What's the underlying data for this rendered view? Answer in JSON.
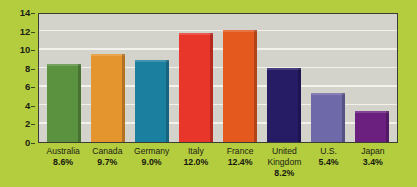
{
  "chart_data": {
    "type": "bar",
    "title": "",
    "xlabel": "",
    "ylabel": "",
    "categories": [
      "Australia",
      "Canada",
      "Germany",
      "Italy",
      "France",
      "United\nKingdom",
      "U.S.",
      "Japan"
    ],
    "values": [
      8.6,
      9.7,
      9.0,
      12.0,
      12.4,
      8.2,
      5.4,
      3.4
    ],
    "data_labels": [
      "8.6%",
      "9.7%",
      "9.0%",
      "12.0%",
      "12.4%",
      "8.2%",
      "5.4%",
      "3.4%"
    ],
    "ylim": [
      0,
      14
    ],
    "yticks": [
      0,
      2,
      4,
      6,
      8,
      10,
      12,
      14
    ],
    "ytick_labels": [
      "0",
      "2",
      "4",
      "6",
      "8",
      "10",
      "12",
      "14"
    ],
    "grid": true,
    "legend": "none",
    "bar_colors": [
      "#5b9240",
      "#e5952d",
      "#1b7f9f",
      "#e8372a",
      "#e4591e",
      "#261c66",
      "#6e69a8",
      "#6b2080"
    ],
    "colors": {
      "background": "#b3cd3e",
      "plot_background": "#d3d2cb",
      "gridline": "#f2f1ec",
      "axis_border": "#3c3c34",
      "text": "#1d1d14"
    }
  }
}
